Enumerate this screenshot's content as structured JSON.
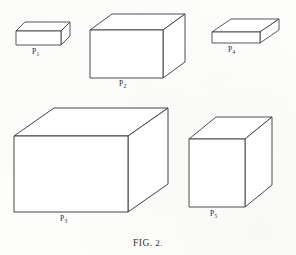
{
  "figure": {
    "caption_prefix": "FIG.",
    "caption_number": "2.",
    "caption_full": "FIG. 2.",
    "background_color": "#fdfdfc",
    "line_color": "#3a3a3a",
    "face_color": "#ffffff",
    "projection": "oblique-parallel",
    "width": 296,
    "height": 255
  },
  "solids": [
    {
      "id": "p1",
      "label_letter": "P",
      "label_subscript": "1",
      "label_text": "P1",
      "description": "small flat rectangular box, top-left",
      "label_x": 32,
      "label_y": 48,
      "front": {
        "x": 16,
        "y": 31,
        "w": 45,
        "h": 14
      },
      "depth_dx": 9,
      "depth_dy": -9
    },
    {
      "id": "p2",
      "label_letter": "P",
      "label_subscript": "2",
      "label_text": "P2",
      "description": "large rectangular box, top-center",
      "label_x": 119,
      "label_y": 80,
      "front": {
        "x": 90,
        "y": 30,
        "w": 73,
        "h": 48
      },
      "depth_dx": 22,
      "depth_dy": -16
    },
    {
      "id": "p4",
      "label_letter": "P",
      "label_subscript": "4",
      "label_text": "P4",
      "description": "thin wide slab, top-right",
      "label_x": 228,
      "label_y": 48,
      "front": {
        "x": 212,
        "y": 32,
        "w": 48,
        "h": 11
      },
      "depth_dx": 19,
      "depth_dy": -13
    },
    {
      "id": "p3",
      "label_letter": "P",
      "label_subscript": "3",
      "label_text": "P3",
      "description": "largest rectangular box, bottom-left",
      "label_x": 60,
      "label_y": 216,
      "front": {
        "x": 14,
        "y": 136,
        "w": 114,
        "h": 76
      },
      "depth_dx": 40,
      "depth_dy": -28
    },
    {
      "id": "p5",
      "label_letter": "P",
      "label_subscript": "5",
      "label_text": "P5",
      "description": "tall rectangular box, bottom-right",
      "label_x": 210,
      "label_y": 211,
      "front": {
        "x": 189,
        "y": 139,
        "w": 56,
        "h": 68
      },
      "depth_dx": 27,
      "depth_dy": -22
    }
  ]
}
